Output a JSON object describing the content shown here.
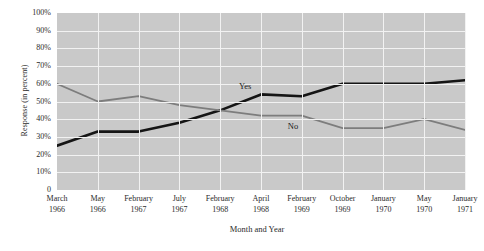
{
  "chart_data": {
    "type": "line",
    "title": "",
    "xlabel": "Month and Year",
    "ylabel": "Response (in percent)",
    "ylim": [
      0,
      100
    ],
    "ytick_labels": [
      "100%",
      "90%",
      "80%",
      "70%",
      "60%",
      "50%",
      "40%",
      "30%",
      "20%",
      "10%",
      "0"
    ],
    "ytick_values": [
      100,
      90,
      80,
      70,
      60,
      50,
      40,
      30,
      20,
      10,
      0
    ],
    "grid": "both",
    "legend_position": "inline-annotations",
    "categories": [
      "March 1966",
      "May 1966",
      "February 1967",
      "July 1967",
      "February 1968",
      "April 1968",
      "February 1969",
      "October 1969",
      "January 1970",
      "May 1970",
      "January 1971"
    ],
    "category_parts": [
      {
        "month": "March",
        "year": "1966"
      },
      {
        "month": "May",
        "year": "1966"
      },
      {
        "month": "February",
        "year": "1967"
      },
      {
        "month": "July",
        "year": "1967"
      },
      {
        "month": "February",
        "year": "1968"
      },
      {
        "month": "April",
        "year": "1968"
      },
      {
        "month": "February",
        "year": "1969"
      },
      {
        "month": "October",
        "year": "1969"
      },
      {
        "month": "January",
        "year": "1970"
      },
      {
        "month": "May",
        "year": "1970"
      },
      {
        "month": "January",
        "year": "1971"
      }
    ],
    "series": [
      {
        "name": "Yes",
        "color": "#151515",
        "width": 2.6,
        "values": [
          25,
          33,
          33,
          38,
          45,
          54,
          53,
          60,
          60,
          60,
          62
        ],
        "annotation": "Yes"
      },
      {
        "name": "No",
        "color": "#7d7d7d",
        "width": 1.8,
        "values": [
          60,
          50,
          53,
          48,
          45,
          42,
          42,
          35,
          35,
          40,
          34
        ],
        "annotation": "No"
      }
    ],
    "plot_background": "#c9c9c9",
    "grid_color": "#f2f2f2"
  }
}
